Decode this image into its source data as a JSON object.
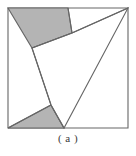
{
  "figure": {
    "caption": "( a )",
    "colors": {
      "shaded_fill": "#b4b4b4",
      "stroke": "#666666",
      "background": "#ffffff",
      "caption_text": "#3a3a3a"
    },
    "outer_square": {
      "name": "outer-square",
      "points": "8,8 128,8 128,128 8,128",
      "fill": "#ffffff",
      "stroke_width": 1.1
    },
    "inner_quadrilateral": {
      "name": "inner-quadrilateral",
      "points": "128,8 72,33 32,48 51,105 64,128",
      "description": "white inscribed region bounded by tilted chords"
    },
    "shapes": [
      {
        "name": "shaded-quad-top-left",
        "points": "8,8 68,8 72,33 32,48",
        "fill": "#b4b4b4",
        "shaded": true
      },
      {
        "name": "shaded-triangle-bottom-left",
        "points": "8,128 64,128 51,105",
        "fill": "#b4b4b4",
        "shaded": true
      }
    ],
    "chords": [
      {
        "name": "chord-top-right",
        "x1": 72,
        "y1": 33,
        "x2": 128,
        "y2": 8
      },
      {
        "name": "chord-top-shaded-right",
        "x1": 68,
        "y1": 8,
        "x2": 72,
        "y2": 33
      },
      {
        "name": "chord-top-shaded-bottom",
        "x1": 72,
        "y1": 33,
        "x2": 32,
        "y2": 48
      },
      {
        "name": "chord-left-diagonal",
        "x1": 32,
        "y1": 48,
        "x2": 51,
        "y2": 105
      },
      {
        "name": "chord-bottom-left-apex",
        "x1": 51,
        "y1": 105,
        "x2": 8,
        "y2": 128
      },
      {
        "name": "chord-bottom-right-apex",
        "x1": 51,
        "y1": 105,
        "x2": 64,
        "y2": 128
      }
    ]
  }
}
